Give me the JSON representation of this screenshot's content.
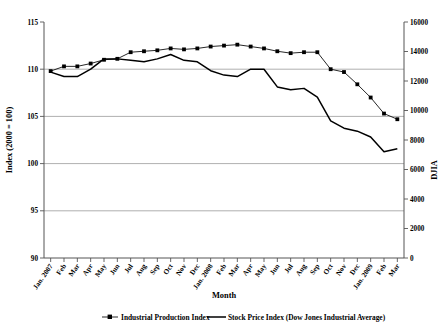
{
  "chart_data": {
    "type": "line",
    "title": "",
    "xlabel": "Month",
    "ylabel": "Index (2000 = 100)",
    "ylabel_right": "DJIA",
    "grid": true,
    "legend_position": "bottom",
    "categories": [
      "Jan. 2007",
      "Feb",
      "Mar",
      "Apr",
      "May",
      "Jun",
      "Jul",
      "Aug",
      "Sep",
      "Oct",
      "Nov",
      "Dec",
      "Jan. 2008",
      "Feb",
      "Mar",
      "Apr",
      "May",
      "Jun",
      "Jul",
      "Aug",
      "Sep",
      "Oct",
      "Nov",
      "Dec",
      "Jan. 2009",
      "Feb",
      "Mar"
    ],
    "ylim": [
      90,
      115
    ],
    "yticks": [
      90,
      95,
      100,
      105,
      110,
      115
    ],
    "ylim_right": [
      0,
      16000
    ],
    "yticks_right": [
      0,
      2000,
      4000,
      6000,
      8000,
      10000,
      12000,
      14000,
      16000
    ],
    "series": [
      {
        "name": "Industrial Production Index",
        "axis": "left",
        "marker": "square",
        "values": [
          109.8,
          110.3,
          110.3,
          110.6,
          111.0,
          111.1,
          111.8,
          111.9,
          112.0,
          112.2,
          112.1,
          112.2,
          112.4,
          112.5,
          112.6,
          112.4,
          112.2,
          111.9,
          111.7,
          111.8,
          111.8,
          110.0,
          109.7,
          108.4,
          107.0,
          105.3,
          104.7
        ],
        "values_plot_y_raw": [
          109.8,
          110.3,
          110.3,
          110.7,
          111.0,
          111.1,
          111.8,
          111.9,
          112.0,
          112.2,
          112.1,
          112.2,
          112.4,
          112.5,
          112.6,
          112.4,
          112.2,
          111.9,
          111.7,
          111.8,
          111.8,
          110.0,
          109.7,
          108.4,
          107.0,
          105.3,
          104.7
        ]
      },
      {
        "name": "Stock Price Index (Dow Jones Industrial Average)",
        "axis": "right",
        "marker": "none",
        "values": [
          12600,
          12300,
          12300,
          12800,
          13500,
          13500,
          13400,
          13300,
          13500,
          13800,
          13400,
          13300,
          12700,
          12400,
          12300,
          12800,
          12800,
          11600,
          11400,
          11500,
          10900,
          9300,
          8800,
          8600,
          8200,
          7200,
          7400
        ]
      }
    ],
    "annotations": []
  },
  "axes": {
    "left_title": "Index (2000 = 100)",
    "right_title": "DJIA",
    "x_title": "Month"
  },
  "legend": {
    "items": [
      {
        "label": "Industrial Production Index",
        "style": "line-with-square-marker"
      },
      {
        "label": "Stock Price Index (Dow Jones Industrial Average)",
        "style": "thick-line"
      }
    ]
  }
}
